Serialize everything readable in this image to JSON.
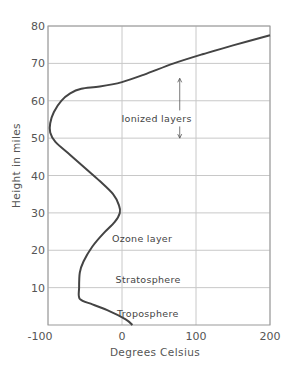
{
  "chart_data": {
    "type": "line",
    "title": "",
    "xlabel": "Degrees Celsius",
    "ylabel": "Height in miles",
    "xlim": [
      -100,
      200
    ],
    "ylim": [
      0,
      80
    ],
    "xticks": [
      -100,
      0,
      100,
      200
    ],
    "yticks": [
      10,
      20,
      30,
      40,
      50,
      60,
      70,
      80
    ],
    "grid": true,
    "legend": null,
    "series": [
      {
        "name": "Temperature profile",
        "x": [
          14,
          5,
          -20,
          -40,
          -57,
          -58,
          -57,
          -52,
          -40,
          -25,
          -10,
          -3,
          -4,
          -12,
          -30,
          -50,
          -70,
          -90,
          -97,
          -97,
          -92,
          -82,
          -70,
          -55,
          -30,
          0,
          30,
          70,
          110,
          150,
          200
        ],
        "y": [
          0,
          1.5,
          4,
          5.5,
          7,
          10,
          14,
          17,
          21,
          24.5,
          27.5,
          30,
          32,
          35,
          38.5,
          42,
          45.5,
          49,
          51.5,
          54,
          57,
          60,
          62,
          63.2,
          63.8,
          65,
          67,
          70,
          72.5,
          74.8,
          77.5
        ]
      }
    ],
    "annotations": [
      {
        "text": "Ionized layers",
        "x": 48,
        "y": 55,
        "arrow": {
          "x": 78,
          "y_from": 50,
          "y_to": 66
        }
      },
      {
        "text": "Ozone layer",
        "x": 35,
        "y": 23
      },
      {
        "text": "Stratosphere",
        "x": 40,
        "y": 12
      },
      {
        "text": "Troposphere",
        "x": 42,
        "y": 3
      }
    ]
  }
}
